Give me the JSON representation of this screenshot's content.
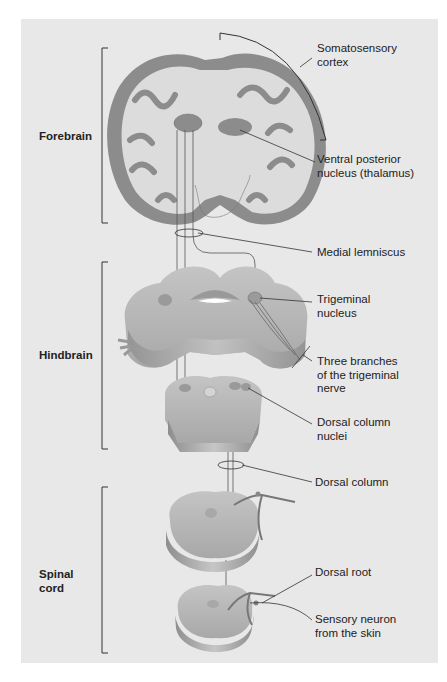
{
  "figure": {
    "regions": [
      {
        "id": "forebrain",
        "label": "Forebrain"
      },
      {
        "id": "hindbrain",
        "label": "Hindbrain"
      },
      {
        "id": "spinal_cord",
        "label": "Spinal\ncord",
        "line1": "Spinal",
        "line2": "cord"
      }
    ],
    "labels": {
      "somatosensory_cortex": {
        "line1": "Somatosensory",
        "line2": "cortex"
      },
      "ventral_posterior_nucleus": {
        "line1": "Ventral posterior",
        "line2": "nucleus (thalamus)"
      },
      "medial_lemniscus": {
        "line1": "Medial lemniscus"
      },
      "trigeminal_nucleus": {
        "line1": "Trigeminal",
        "line2": "nucleus"
      },
      "trigeminal_branches": {
        "line1": "Three branches",
        "line2": "of the trigeminal",
        "line3": "nerve"
      },
      "dorsal_column_nuclei": {
        "line1": "Dorsal column",
        "line2": "nuclei"
      },
      "dorsal_column": {
        "line1": "Dorsal column"
      },
      "dorsal_root": {
        "line1": "Dorsal root"
      },
      "sensory_neuron": {
        "line1": "Sensory neuron",
        "line2": "from the skin"
      }
    },
    "colors": {
      "background": "#e8e8e8",
      "cortex_gray": "#8c8c8c",
      "white_matter": "#dcdcdc",
      "tissue": "#b4b4b4",
      "line": "#333333"
    }
  }
}
